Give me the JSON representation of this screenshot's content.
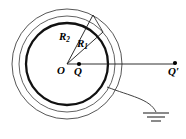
{
  "figure": {
    "kind": "physics-diagram",
    "background_color": "#ffffff",
    "stroke_color": "#1a1a1a",
    "thin_stroke_width": 0.8,
    "thick_stroke_width": 2.2,
    "labels": {
      "outer_radius": {
        "base": "R",
        "sub": "2"
      },
      "inner_radius": {
        "base": "R",
        "sub": "1"
      },
      "center": "O",
      "inner_charge": "Q",
      "outer_charge": {
        "base": "Q",
        "prime": "′"
      }
    },
    "geometry": {
      "center": {
        "x": 67,
        "y": 64
      },
      "circles": [
        {
          "name": "outer-shell-circle",
          "radius": 55,
          "stroke": "thin"
        },
        {
          "name": "middle-shell-circle",
          "radius": 48,
          "stroke": "thin"
        },
        {
          "name": "inner-conductor-circle",
          "radius": 41,
          "stroke": "thick"
        }
      ],
      "radius_lines": [
        {
          "name": "R2",
          "angle_deg": 62,
          "length": 55
        },
        {
          "name": "R1",
          "angle_deg": 42,
          "length": 48
        }
      ],
      "axis_line": {
        "from": {
          "x": 67,
          "y": 64
        },
        "to": {
          "x": 176,
          "y": 64
        }
      },
      "points": [
        {
          "name": "O",
          "x": 67,
          "y": 64,
          "dot": false
        },
        {
          "name": "Q",
          "x": 79,
          "y": 64,
          "dot": true
        },
        {
          "name": "Qprime",
          "x": 175,
          "y": 64,
          "dot": true
        }
      ],
      "ground": {
        "wire_start": {
          "x": 107,
          "y": 87
        },
        "wire_end": {
          "x": 156,
          "y": 112
        },
        "bars": [
          {
            "half_width": 13,
            "y": 114
          },
          {
            "half_width": 9,
            "y": 118
          },
          {
            "half_width": 5,
            "y": 122
          }
        ]
      }
    }
  }
}
